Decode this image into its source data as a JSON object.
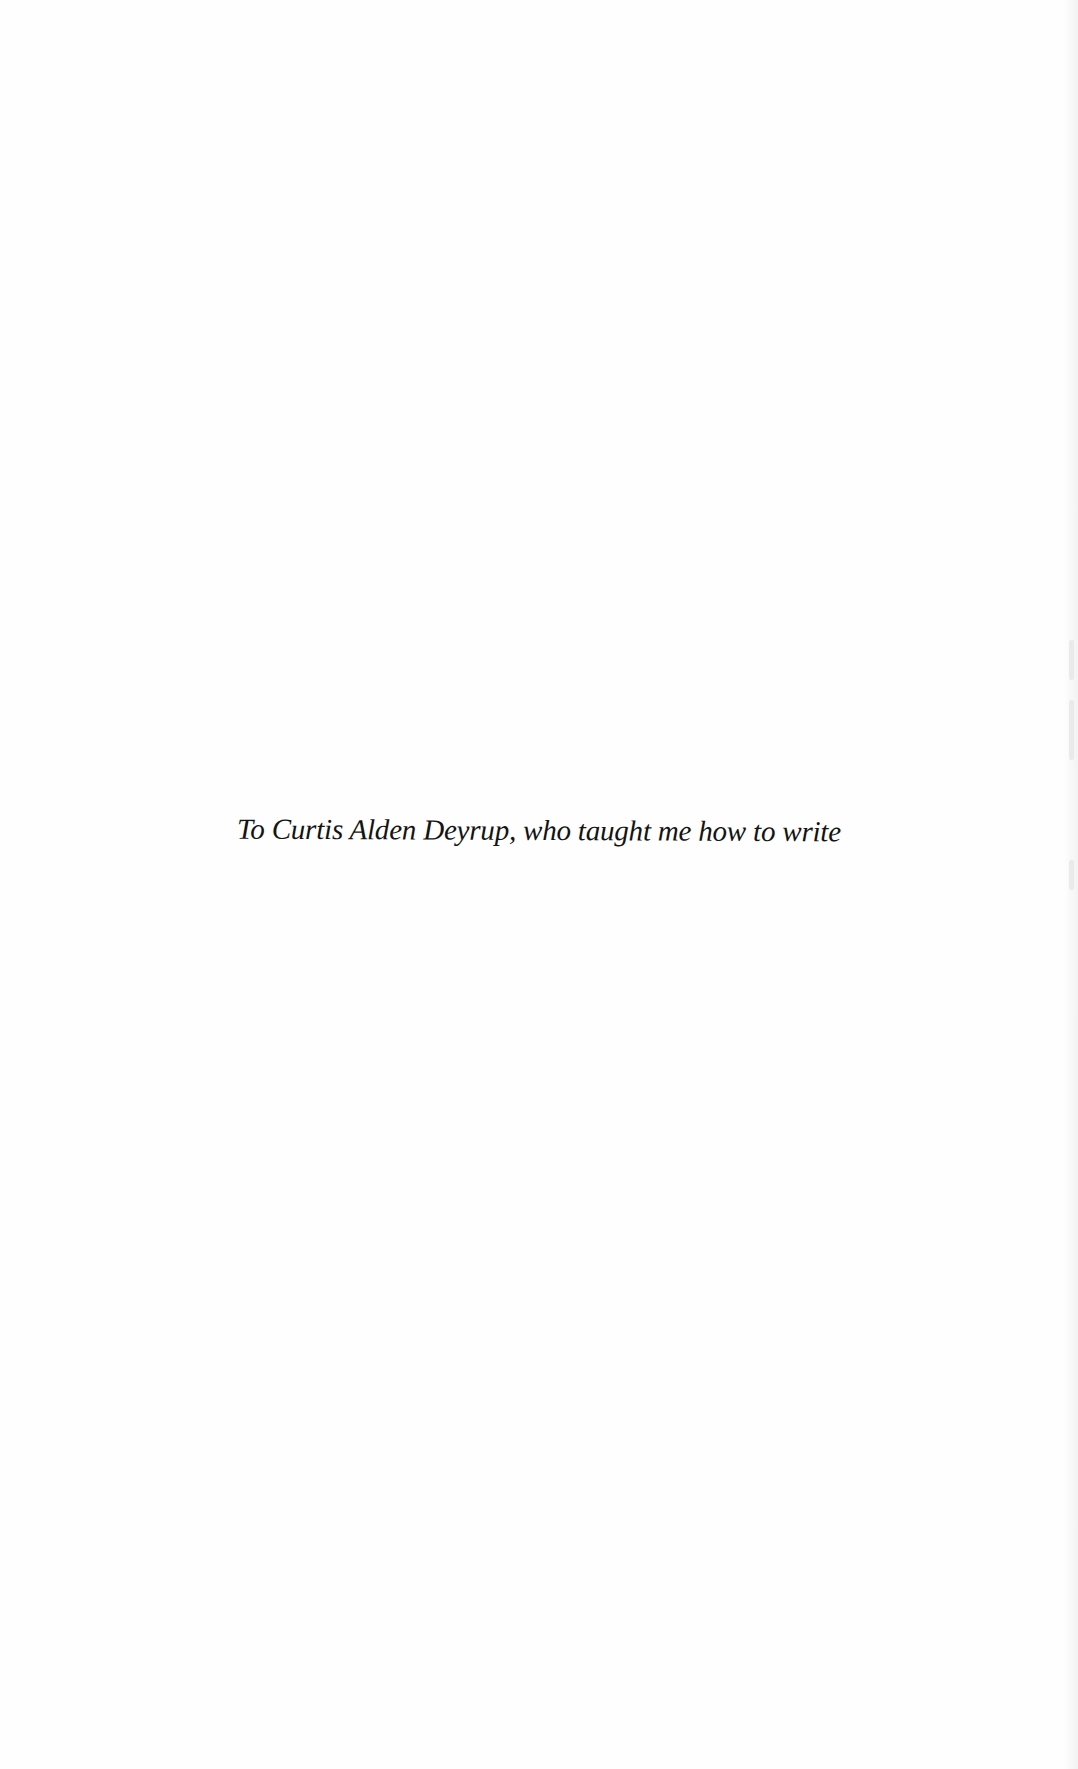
{
  "page": {
    "type": "dedication",
    "dedication_text": "To Curtis Alden Deyrup, who taught me how to write"
  }
}
